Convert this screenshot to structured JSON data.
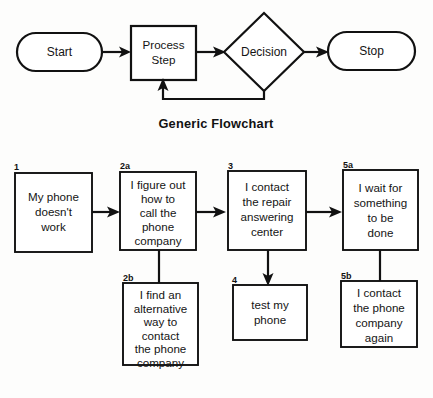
{
  "figure": {
    "background_color": "#fdfdfc",
    "line_color": "#111111",
    "shape_fill": "#ffffff"
  },
  "generic_flowchart": {
    "caption": "Generic Flowchart",
    "nodes": [
      {
        "id": "start",
        "shape": "terminator",
        "label": "Start"
      },
      {
        "id": "process",
        "shape": "process",
        "label_line_1": "Process",
        "label_line_2": "Step"
      },
      {
        "id": "decision",
        "shape": "decision",
        "label": "Decision"
      },
      {
        "id": "stop",
        "shape": "terminator",
        "label": "Stop"
      }
    ],
    "connectors": [
      {
        "from": "start",
        "to": "process",
        "arrow": true
      },
      {
        "from": "process",
        "to": "decision",
        "arrow": true
      },
      {
        "from": "decision",
        "to": "stop",
        "arrow": true
      },
      {
        "from": "decision",
        "to": "process",
        "arrow": true,
        "style": "feedback-loop"
      }
    ]
  },
  "phone_flowchart": {
    "boxes": [
      {
        "id": "box1",
        "number": "1",
        "lines": [
          "My phone",
          "doesn't",
          "work"
        ]
      },
      {
        "id": "box2a",
        "number": "2a",
        "lines": [
          "I figure out",
          "how to",
          "call the",
          "phone",
          "company"
        ]
      },
      {
        "id": "box2b",
        "number": "2b",
        "lines": [
          "I find an",
          "alternative",
          "way to",
          "contact",
          "the phone",
          "company"
        ]
      },
      {
        "id": "box3",
        "number": "3",
        "lines": [
          "I contact",
          "the repair",
          "answering",
          "center"
        ]
      },
      {
        "id": "box4",
        "number": "4",
        "lines": [
          "test my",
          "phone"
        ]
      },
      {
        "id": "box5a",
        "number": "5a",
        "lines": [
          "I wait for",
          "something",
          "to be",
          "done"
        ]
      },
      {
        "id": "box5b",
        "number": "5b",
        "lines": [
          "I contact",
          "the phone",
          "company",
          "again"
        ]
      }
    ],
    "connectors": [
      {
        "from": "box1",
        "to": "box2a",
        "arrow": true,
        "direction": "right"
      },
      {
        "from": "box2a",
        "to": "box3",
        "arrow": true,
        "direction": "right"
      },
      {
        "from": "box3",
        "to": "box5a",
        "arrow": true,
        "direction": "right"
      },
      {
        "from": "box2a",
        "to": "box2b",
        "arrow": false,
        "direction": "down"
      },
      {
        "from": "box3",
        "to": "box4",
        "arrow": true,
        "direction": "down"
      },
      {
        "from": "box5a",
        "to": "box5b",
        "arrow": false,
        "direction": "down"
      }
    ]
  }
}
